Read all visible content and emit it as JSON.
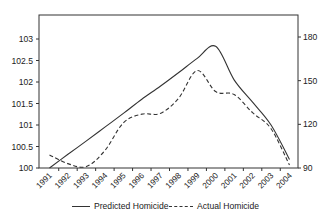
{
  "chart_data": {
    "type": "line",
    "title": "",
    "xlabel": "",
    "ylabel": "",
    "categories": [
      "1991",
      "1992",
      "1993",
      "1994",
      "1995",
      "1996",
      "1997",
      "1998",
      "1999",
      "2000",
      "2001",
      "2002",
      "2003",
      "2004"
    ],
    "series": [
      {
        "name": "Predicted Homicide",
        "axis": "left",
        "style": "solid",
        "values": [
          100.0,
          100.32,
          100.63,
          100.95,
          101.27,
          101.6,
          101.9,
          102.22,
          102.55,
          102.83,
          102.05,
          101.53,
          101.0,
          100.2
        ]
      },
      {
        "name": "Actual Homicide",
        "axis": "right",
        "style": "dashed",
        "values": [
          99,
          93,
          91,
          102,
          121,
          127,
          127.5,
          138,
          157,
          142.5,
          140.5,
          128,
          117,
          92
        ]
      }
    ],
    "left_axis": {
      "ylim": [
        100,
        103.5
      ],
      "ticks": [
        "100",
        "100.5",
        "101",
        "101.5",
        "102",
        "102.5",
        "103"
      ]
    },
    "right_axis": {
      "ylim": [
        90,
        183
      ],
      "ticks": [
        "90",
        "120",
        "150",
        "180"
      ]
    },
    "grid": false,
    "legend_position": "bottom"
  },
  "legend": {
    "items": [
      {
        "label": "Predicted Homicide",
        "style": "solid"
      },
      {
        "label": "Actual Homicide",
        "style": "dashed"
      }
    ]
  },
  "colors": {
    "line": "#333333",
    "axis": "#333333",
    "text": "#222222"
  }
}
